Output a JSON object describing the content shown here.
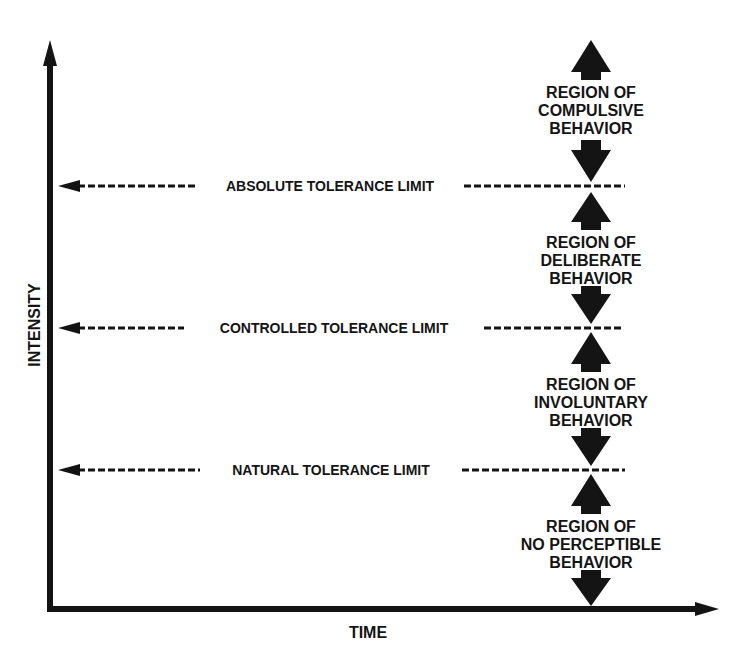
{
  "diagram": {
    "axes": {
      "x_label": "TIME",
      "y_label": "INTENSITY"
    },
    "limits": [
      {
        "label": "ABSOLUTE TOLERANCE LIMIT",
        "y": 186
      },
      {
        "label": "CONTROLLED TOLERANCE LIMIT",
        "y": 328
      },
      {
        "label": "NATURAL TOLERANCE LIMIT",
        "y": 470
      }
    ],
    "regions": [
      {
        "lines": [
          "REGION OF",
          "COMPULSIVE",
          "BEHAVIOR"
        ]
      },
      {
        "lines": [
          "REGION OF",
          "DELIBERATE",
          "BEHAVIOR"
        ]
      },
      {
        "lines": [
          "REGION OF",
          "INVOLUNTARY",
          "BEHAVIOR"
        ]
      },
      {
        "lines": [
          "REGION OF",
          "NO PERCEPTIBLE",
          "BEHAVIOR"
        ]
      }
    ],
    "colors": {
      "ink": "#141414",
      "background": "#ffffff"
    }
  }
}
